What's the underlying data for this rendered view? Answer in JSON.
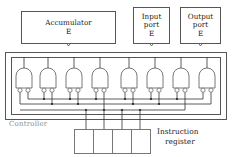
{
  "diagram": {
    "title_hidden": "Controller and datapath block diagram",
    "blocks": {
      "accumulator": {
        "label": "Accumulator",
        "enable": "E",
        "port_icon": "enable-port-circle"
      },
      "input_port": {
        "label_line1": "Input",
        "label_line2": "port",
        "enable": "E",
        "port_icon": "enable-port-circle"
      },
      "output_port": {
        "label_line1": "Output",
        "label_line2": "port",
        "enable": "E",
        "port_icon": "enable-port-circle"
      }
    },
    "controller": {
      "label": "Controller",
      "label_color": "#8a8a8a",
      "gate_count": 8,
      "gate_type": "and-gate-inverted-inputs",
      "inputs_per_gate": 2
    },
    "instruction_register": {
      "label_line1": "Instruction",
      "label_line2": "register",
      "cells": [
        "",
        "",
        "",
        ""
      ],
      "cell_count": 4
    },
    "colors": {
      "line": "#333333",
      "box_border": "#555555",
      "text": "#222222",
      "muted_text": "#8a8a8a",
      "background": "#ffffff"
    }
  }
}
